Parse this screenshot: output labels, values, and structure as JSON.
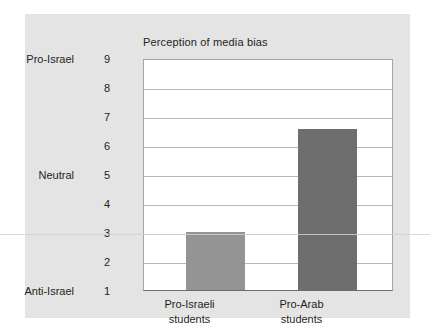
{
  "chart_data": {
    "type": "bar",
    "title": "Perception of media bias",
    "xlabel": "",
    "ylabel": "",
    "categories": [
      "Pro-Israeli students",
      "Pro-Arab students"
    ],
    "category_lines": [
      [
        "Pro-Israeli",
        "students"
      ],
      [
        "Pro-Arab",
        "students"
      ]
    ],
    "values": [
      3.0,
      6.55
    ],
    "ylim": [
      1,
      9
    ],
    "yticks": [
      1,
      2,
      3,
      4,
      5,
      6,
      7,
      8,
      9
    ],
    "ytick_labels": [
      "1",
      "2",
      "3",
      "4",
      "5",
      "6",
      "7",
      "8",
      "9"
    ],
    "y_category_labels": [
      {
        "value": 9,
        "label": "Pro-Israel"
      },
      {
        "value": 5,
        "label": "Neutral"
      },
      {
        "value": 1,
        "label": "Anti-Israel"
      }
    ],
    "grid": true,
    "legend": false,
    "bar_colors": [
      "#949494",
      "#6e6e6e"
    ]
  },
  "style": {
    "panel_background": "#e4e4e4",
    "plot_background": "#ffffff",
    "gridline_color": "#b9b9b9",
    "axis_color": "#6d6d6d",
    "text_color": "#231f20"
  }
}
